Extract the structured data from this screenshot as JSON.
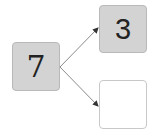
{
  "diagram": {
    "type": "number-decomposition-tree",
    "root": {
      "value": "7",
      "fill": "#d3d3d3"
    },
    "children": [
      {
        "value": "3",
        "fill": "#d3d3d3"
      },
      {
        "value": "",
        "fill": "#ffffff"
      }
    ],
    "edge_color": "#8a8a8a"
  }
}
